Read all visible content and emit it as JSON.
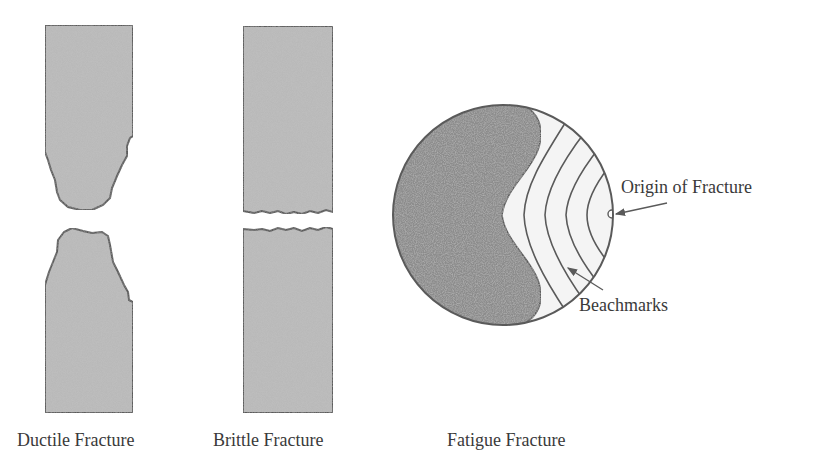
{
  "figure": {
    "panels": [
      {
        "id": "ductile",
        "caption": "Ductile Fracture"
      },
      {
        "id": "brittle",
        "caption": "Brittle Fracture"
      },
      {
        "id": "fatigue",
        "caption": "Fatigue Fracture"
      }
    ],
    "annotations": {
      "origin": "Origin of Fracture",
      "beachmarks": "Beachmarks"
    },
    "colors": {
      "specimen_fill": "#b9b9b9",
      "outline": "#5a5a5a",
      "rough_zone": "#8c8c8c",
      "smooth_zone": "#f4f4f4",
      "text": "#3a3a3a"
    }
  }
}
